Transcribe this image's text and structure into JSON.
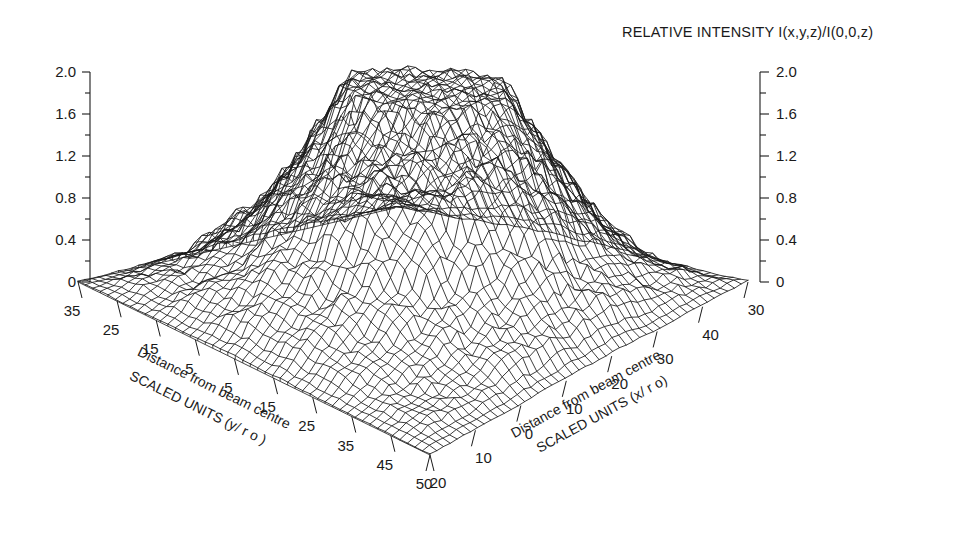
{
  "figure": {
    "title": "RELATIVE INTENSITY I(x,y,z)/I(0,0,z)",
    "background": "#ffffff",
    "line_color": "#1a1a1a"
  },
  "axes": {
    "z_left": {
      "labels": [
        "2.0",
        "1.6",
        "1.2",
        "0.8",
        "0.4",
        "0"
      ],
      "values": [
        2.0,
        1.6,
        1.2,
        0.8,
        0.4,
        0
      ],
      "minor_ticks": true
    },
    "z_right": {
      "labels": [
        "2.0",
        "1.6",
        "1.2",
        "0.8",
        "0.4",
        "0"
      ],
      "values": [
        2.0,
        1.6,
        1.2,
        0.8,
        0.4,
        0
      ],
      "minor_ticks": true
    },
    "y_axis": {
      "labels": [
        "35",
        "25",
        "15",
        "5",
        "5",
        "15",
        "25",
        "35",
        "45",
        "50"
      ],
      "values": [
        -35,
        -25,
        -15,
        -5,
        5,
        15,
        25,
        35,
        45,
        50
      ],
      "title_line1": "Distance from beam centre",
      "title_line2": "SCALED UNITS (y/ r o )"
    },
    "x_axis": {
      "labels": [
        "20",
        "10",
        "0",
        "10",
        "20",
        "30",
        "40",
        "30"
      ],
      "values": [
        -20,
        -10,
        0,
        10,
        20,
        30,
        40,
        30
      ],
      "title_line1": "Distance from beam centre",
      "title_line2": "SCALED UNITS (x/ r o)"
    }
  },
  "chart_data": {
    "type": "surface",
    "title": "RELATIVE INTENSITY I(x,y,z)/I(0,0,z)",
    "xlabel": "Distance from beam centre SCALED UNITS (x/ r o)",
    "ylabel": "Distance from beam centre SCALED UNITS (y/ r o )",
    "zlabel": "RELATIVE INTENSITY I(x,y,z)/I(0,0,z)",
    "zlim": [
      0,
      2.0
    ],
    "z_ticks": [
      0,
      0.4,
      0.8,
      1.2,
      1.6,
      2.0
    ],
    "xlim": [
      -25,
      35
    ],
    "x_ticks": [
      -20,
      -10,
      0,
      10,
      20,
      30
    ],
    "ylim": [
      -40,
      50
    ],
    "y_ticks": [
      -35,
      -25,
      -15,
      -5,
      5,
      15,
      25,
      35,
      45
    ],
    "grid": false,
    "legend": false,
    "render": "wireframe",
    "nx": 48,
    "ny": 48,
    "peak_value": 1.95,
    "noise_amplitude": 0.22
  }
}
